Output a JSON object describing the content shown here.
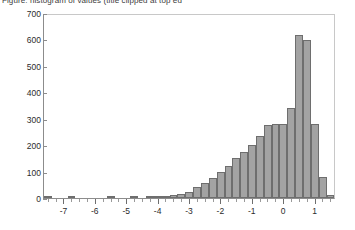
{
  "title": "Figure: histogram of values (title clipped at top edge)",
  "chart_data": {
    "type": "bar",
    "title": "",
    "xlabel": "",
    "ylabel": "",
    "xlim": [
      -7.65,
      1.65
    ],
    "ylim": [
      0,
      700
    ],
    "grid": false,
    "legend": null,
    "bin_width": 0.25,
    "bar_color": "#a3a3a3",
    "bar_edge_color": "#6e6e6e",
    "y_ticks": [
      0,
      100,
      200,
      300,
      400,
      500,
      600,
      700
    ],
    "y_tick_labels": [
      "0",
      "100",
      "200",
      "300",
      "400",
      "500",
      "600",
      "700"
    ],
    "x_ticks": [
      -7,
      -6,
      -5,
      -4,
      -3,
      -2,
      -1,
      0,
      1
    ],
    "x_tick_labels": [
      "-7",
      "-6",
      "-5",
      "-4",
      "-3",
      "-2",
      "-1",
      "0",
      "1"
    ],
    "x_minor_tick_step": 0.25,
    "bin_left_edges": [
      -7.65,
      -7.4,
      -7.15,
      -6.9,
      -6.65,
      -6.4,
      -6.15,
      -5.9,
      -5.65,
      -5.4,
      -5.15,
      -4.9,
      -4.65,
      -4.4,
      -4.15,
      -3.9,
      -3.65,
      -3.4,
      -3.15,
      -2.9,
      -2.65,
      -2.4,
      -2.15,
      -1.9,
      -1.65,
      -1.4,
      -1.15,
      -0.9,
      -0.65,
      -0.4,
      -0.15,
      0.1,
      0.35,
      0.6,
      0.85,
      1.1,
      1.35
    ],
    "categories": [
      "-7.65",
      "-7.40",
      "-7.15",
      "-6.90",
      "-6.65",
      "-6.40",
      "-6.15",
      "-5.90",
      "-5.65",
      "-5.40",
      "-5.15",
      "-4.90",
      "-4.65",
      "-4.40",
      "-4.15",
      "-3.90",
      "-3.65",
      "-3.40",
      "-3.15",
      "-2.90",
      "-2.65",
      "-2.40",
      "-2.15",
      "-1.90",
      "-1.65",
      "-1.40",
      "-1.15",
      "-0.90",
      "-0.65",
      "-0.40",
      "-0.15",
      "0.10",
      "0.35",
      "0.60",
      "0.85",
      "1.10",
      "1.35"
    ],
    "values": [
      3,
      0,
      0,
      2,
      0,
      0,
      0,
      0,
      3,
      0,
      0,
      2,
      0,
      2,
      3,
      6,
      10,
      15,
      22,
      40,
      55,
      75,
      100,
      120,
      150,
      175,
      200,
      235,
      275,
      280,
      280,
      340,
      617,
      598,
      280,
      80,
      10
    ]
  }
}
